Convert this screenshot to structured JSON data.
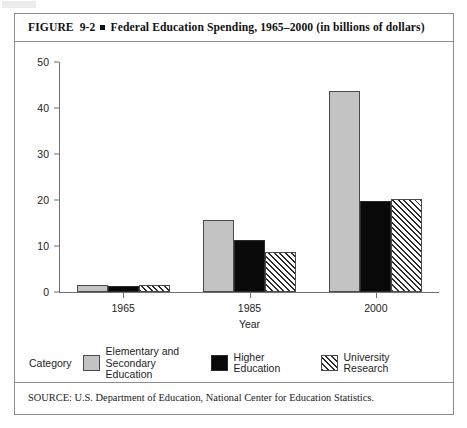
{
  "figure": {
    "label": "FIGURE",
    "number": "9-2",
    "separator": "square-bullet",
    "title": "Federal Education Spending, 1965–2000 (in billions of dollars)",
    "source": "SOURCE: U.S. Department of Education, National Center for Education Statistics."
  },
  "legend": {
    "caption": "Category",
    "entries": [
      {
        "label": "Elementary and\nSecondary Education",
        "swatch": "elementary",
        "color": "#c3c3c3"
      },
      {
        "label": "Higher Education",
        "swatch": "higher",
        "color": "#090909"
      },
      {
        "label": "University Research",
        "swatch": "research",
        "color": "#ffffff"
      }
    ]
  },
  "chart_data": {
    "type": "bar",
    "title": "Federal Education Spending, 1965–2000 (in billions of dollars)",
    "xlabel": "Year",
    "ylabel": "",
    "categories": [
      "1965",
      "1985",
      "2000"
    ],
    "series": [
      {
        "name": "Elementary and Secondary Education",
        "values": [
          1.6,
          15.7,
          43.8
        ],
        "color": "#c3c3c3",
        "fill": "solid-gray"
      },
      {
        "name": "Higher Education",
        "values": [
          1.2,
          11.3,
          19.8
        ],
        "color": "#090909",
        "fill": "solid-black"
      },
      {
        "name": "University Research",
        "values": [
          1.5,
          8.6,
          20.3
        ],
        "color": "#ffffff",
        "fill": "diagonal-hatch"
      }
    ],
    "ylim": [
      0,
      50
    ],
    "yticks": [
      0,
      10,
      20,
      30,
      40,
      50
    ],
    "ytick_labels": [
      "0",
      "10",
      "20",
      "30",
      "40",
      "50"
    ],
    "grid": false,
    "legend_position": "bottom",
    "units": "billions of dollars"
  }
}
